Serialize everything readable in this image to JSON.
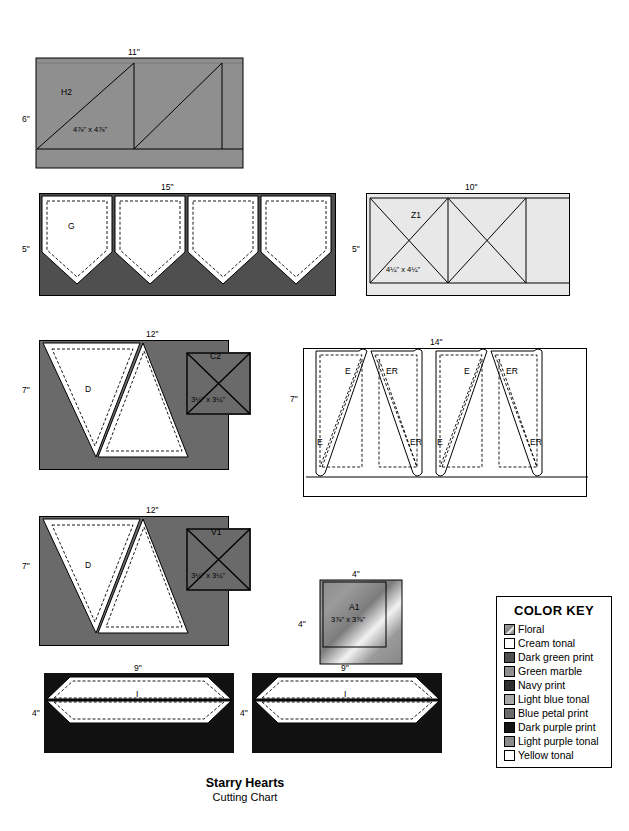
{
  "title": {
    "main": "Starry Hearts",
    "sub": "Cutting Chart"
  },
  "blocks": [
    {
      "id": "h2",
      "label": "H2",
      "fabric": "green-marble",
      "width_label": "11\"",
      "height_label": "6\"",
      "cut_label": "4⅞\" x 4⅞\""
    },
    {
      "id": "g",
      "label": "G",
      "fabric": "dark-green-print",
      "width_label": "15\"",
      "height_label": "5\"",
      "cut_label": ""
    },
    {
      "id": "z1",
      "label": "Z1",
      "fabric": "light-blue-tonal",
      "width_label": "10\"",
      "height_label": "5\"",
      "cut_label": "4¼\" x 4¼\""
    },
    {
      "id": "d1",
      "label": "D",
      "fabric": "blue-petal-print",
      "width_label": "12\"",
      "height_label": "7\"",
      "cut_label": ""
    },
    {
      "id": "c2",
      "label": "C2",
      "fabric": "blue-petal-print",
      "width_label": "",
      "height_label": "",
      "cut_label": "3¼\" x 3¼\""
    },
    {
      "id": "e",
      "label": "E",
      "fabric": "cream-tonal",
      "width_label": "14\"",
      "height_label": "7\"",
      "cut_label": ""
    },
    {
      "id": "d2",
      "label": "D",
      "fabric": "blue-petal-print",
      "width_label": "12\"",
      "height_label": "7\"",
      "cut_label": ""
    },
    {
      "id": "v1",
      "label": "V1",
      "fabric": "blue-petal-print",
      "width_label": "",
      "height_label": "",
      "cut_label": "3¼\" x 3¼\""
    },
    {
      "id": "a1",
      "label": "A1",
      "fabric": "floral",
      "width_label": "4\"",
      "height_label": "4\"",
      "cut_label": "3⅞\" x 3⅞\""
    },
    {
      "id": "i1",
      "label": "I",
      "fabric": "dark-purple-print",
      "width_label": "9\"",
      "height_label": "4\"",
      "cut_label": ""
    },
    {
      "id": "i2",
      "label": "I",
      "fabric": "dark-purple-print",
      "width_label": "9\"",
      "height_label": "4\"",
      "cut_label": ""
    }
  ],
  "e_column_labels": [
    {
      "top": "E",
      "bottom": "E"
    },
    {
      "top": "ER",
      "bottom": "ER"
    },
    {
      "top": "E",
      "bottom": "E"
    },
    {
      "top": "ER",
      "bottom": "ER"
    }
  ],
  "g_piece_labels": [
    "G",
    "",
    "",
    ""
  ],
  "color_key": {
    "title": "COLOR KEY",
    "items": [
      {
        "name": "Floral",
        "swatch": "floral",
        "color": "#9a9a9a"
      },
      {
        "name": "Cream tonal",
        "swatch": "solid",
        "color": "#ffffff"
      },
      {
        "name": "Dark green print",
        "swatch": "solid",
        "color": "#4f4f4f"
      },
      {
        "name": "Green marble",
        "swatch": "solid",
        "color": "#8f8f8f"
      },
      {
        "name": "Navy print",
        "swatch": "solid",
        "color": "#2e2e2e"
      },
      {
        "name": "Light blue tonal",
        "swatch": "solid",
        "color": "#a8a8a8"
      },
      {
        "name": "Blue petal print",
        "swatch": "solid",
        "color": "#6a6a6a"
      },
      {
        "name": "Dark purple print",
        "swatch": "solid",
        "color": "#141414"
      },
      {
        "name": "Light purple tonal",
        "swatch": "solid",
        "color": "#8a8a8a"
      },
      {
        "name": "Yellow tonal",
        "swatch": "solid",
        "color": "#ffffff"
      }
    ]
  }
}
